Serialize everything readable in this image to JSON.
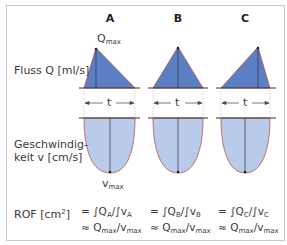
{
  "columns": [
    {
      "id": "A",
      "label": "A",
      "formula_1_pre": "= ∫Q",
      "formula_1_sub_q": "A",
      "formula_1_mid": "/∫v",
      "formula_1_sub_v": "A"
    },
    {
      "id": "B",
      "label": "B",
      "formula_1_pre": "= ∫Q",
      "formula_1_sub_q": "B",
      "formula_1_mid": "/∫v",
      "formula_1_sub_v": "B"
    },
    {
      "id": "C",
      "label": "C",
      "formula_1_pre": "= ∫Q",
      "formula_1_sub_q": "C",
      "formula_1_mid": "/∫v",
      "formula_1_sub_v": "C"
    }
  ],
  "labels": {
    "flow": "Fluss Q [ml/s]",
    "velocity_line1": "Geschwindig-",
    "velocity_line2": "keit v [cm/s]",
    "rof_pre": "ROF [cm",
    "rof_sup": "2",
    "rof_post": "]",
    "qmax_base": "Q",
    "qmax_sub": "max",
    "vmax_base": "v",
    "vmax_sub": "max",
    "duration": "t"
  },
  "approx": {
    "pre": "≈ Q",
    "sub1": "max",
    "mid": "/v",
    "sub2": "max"
  },
  "colors": {
    "triangle_fill": "#5a7fc4",
    "parabola_fill": "#b8cbea",
    "outline": "#b5534e",
    "axis": "#333333",
    "frame": "#c8c8c8"
  }
}
